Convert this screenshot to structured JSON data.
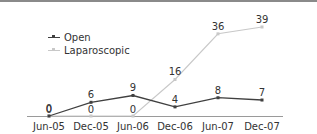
{
  "chart_data": {
    "type": "line",
    "title": "",
    "xlabel": "",
    "ylabel": "",
    "categories": [
      "Jun-05",
      "Dec-05",
      "Jun-06",
      "Dec-06",
      "Jun-07",
      "Dec-07"
    ],
    "series": [
      {
        "name": "Open",
        "values": [
          0,
          6,
          9,
          4,
          8,
          7
        ],
        "color": "#404040"
      },
      {
        "name": "Laparoscopic",
        "values": [
          0,
          0,
          0,
          16,
          36,
          39
        ],
        "color": "#c8c8c8"
      }
    ],
    "ylim": [
      0,
      40
    ],
    "grid": false,
    "legend_position": "upper-left",
    "data_labels": true
  },
  "legend": {
    "items": [
      {
        "label": "Open",
        "color": "#404040"
      },
      {
        "label": "Laparoscopic",
        "color": "#c8c8c8"
      }
    ]
  }
}
